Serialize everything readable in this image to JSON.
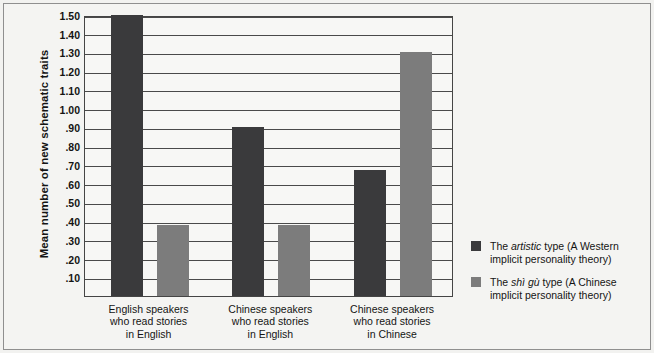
{
  "chart_data": {
    "type": "bar",
    "title": "",
    "xlabel": "",
    "ylabel": "Mean number of new schematic traits",
    "ylim": [
      0,
      1.5
    ],
    "grid": true,
    "legend_position": "right",
    "categories": [
      "English speakers\nwho read stories\nin English",
      "Chinese speakers\nwho read stories\nin English",
      "Chinese speakers\nwho read stories\nin Chinese"
    ],
    "yticks": [
      "1.50",
      "1.40",
      "1.30",
      "1.20",
      "1.10",
      "1.00",
      ".90",
      ".80",
      ".70",
      ".60",
      ".50",
      ".40",
      ".30",
      ".20",
      ".10"
    ],
    "ytick_values": [
      1.5,
      1.4,
      1.3,
      1.2,
      1.1,
      1.0,
      0.9,
      0.8,
      0.7,
      0.6,
      0.5,
      0.4,
      0.3,
      0.2,
      0.1
    ],
    "series": [
      {
        "name": "The artistic type (A Western implicit personality theory)",
        "color": "#3a3a3c",
        "values": [
          1.5,
          0.9,
          0.675
        ]
      },
      {
        "name": "The shì gù type (A Chinese implicit personality theory)",
        "color": "#7c7c7c",
        "values": [
          0.38,
          0.38,
          1.3
        ]
      }
    ]
  },
  "axis": {
    "y_title": "Mean number of new schematic traits",
    "ticks": [
      "1.50",
      "1.40",
      "1.30",
      "1.20",
      "1.10",
      "1.00",
      ".90",
      ".80",
      ".70",
      ".60",
      ".50",
      ".40",
      ".30",
      ".20",
      ".10"
    ]
  },
  "categories": [
    {
      "line1": "English speakers",
      "line2": "who read stories",
      "line3": "in English"
    },
    {
      "line1": "Chinese speakers",
      "line2": "who read stories",
      "line3": "in English"
    },
    {
      "line1": "Chinese speakers",
      "line2": "who read stories",
      "line3": "in Chinese"
    }
  ],
  "legend": {
    "items": [
      {
        "swatch": "dark",
        "prefix": "The ",
        "italic": "artistic",
        "suffix": " type (A Western implicit personality theory)"
      },
      {
        "swatch": "light",
        "prefix": "The ",
        "italic": "shì gù",
        "suffix": " type (A Chinese implicit personality theory)"
      }
    ]
  },
  "colors": {
    "dark_bar": "#3a3a3c",
    "light_bar": "#7c7c7c",
    "background": "#f4f4f2",
    "axis": "#454545"
  }
}
